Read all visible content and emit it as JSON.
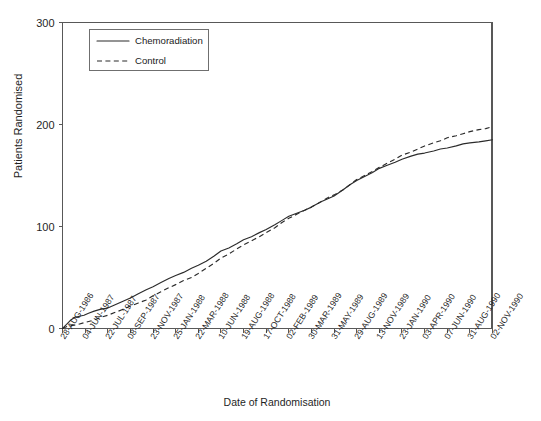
{
  "chart_data": {
    "type": "line",
    "title": "",
    "subtitle": "",
    "xlabel": "Date of Randomisation",
    "ylabel": "Patients Randomised",
    "grid": false,
    "legend_position": "top-left",
    "ylim": [
      0,
      300
    ],
    "yticks": [
      0,
      100,
      200,
      300
    ],
    "ytick_labels": [
      "0",
      "100",
      "200",
      "300"
    ],
    "categories": [
      "28-AUG-1986",
      "04-JUN-1987",
      "22-JUL-1987",
      "08-SEP-1987",
      "23-NOV-1987",
      "25-JAN-1988",
      "22-MAR-1988",
      "10-JUN-1988",
      "19-AUG-1988",
      "17-OCT-1988",
      "02-FEB-1989",
      "30-MAR-1989",
      "31-MAY-1989",
      "29-AUG-1989",
      "13-NOV-1989",
      "23-JAN-1990",
      "03-APR-1990",
      "07-JUN-1990",
      "31-AUG-1990",
      "02-NOV-1990"
    ],
    "series": [
      {
        "name": "Chemoradiation",
        "style": "solid",
        "color": "#2b2b2b",
        "values": [
          0,
          13,
          20,
          30,
          41,
          52,
          62,
          76,
          87,
          97,
          110,
          119,
          130,
          145,
          157,
          166,
          172,
          177,
          182,
          185
        ]
      },
      {
        "name": "Control",
        "style": "dashed",
        "color": "#2b2b2b",
        "values": [
          0,
          6,
          13,
          22,
          32,
          43,
          54,
          69,
          82,
          94,
          108,
          119,
          131,
          146,
          158,
          170,
          179,
          187,
          193,
          198
        ]
      }
    ],
    "series_detail": [
      {
        "name": "Chemoradiation",
        "points": [
          [
            0.0,
            0
          ],
          [
            0.18,
            4
          ],
          [
            0.35,
            8
          ],
          [
            0.55,
            11
          ],
          [
            0.75,
            12
          ],
          [
            0.95,
            13
          ],
          [
            1.15,
            15
          ],
          [
            1.4,
            17
          ],
          [
            1.7,
            19
          ],
          [
            2.0,
            20
          ],
          [
            2.3,
            23
          ],
          [
            2.6,
            26
          ],
          [
            3.0,
            30
          ],
          [
            3.35,
            34
          ],
          [
            3.7,
            38
          ],
          [
            4.0,
            41
          ],
          [
            4.35,
            45
          ],
          [
            4.7,
            49
          ],
          [
            5.0,
            52
          ],
          [
            5.35,
            55
          ],
          [
            5.7,
            59
          ],
          [
            6.0,
            62
          ],
          [
            6.35,
            66
          ],
          [
            6.7,
            71
          ],
          [
            7.0,
            76
          ],
          [
            7.35,
            79
          ],
          [
            7.7,
            83
          ],
          [
            8.0,
            87
          ],
          [
            8.35,
            90
          ],
          [
            8.7,
            94
          ],
          [
            9.0,
            97
          ],
          [
            9.4,
            102
          ],
          [
            9.7,
            106
          ],
          [
            10.0,
            110
          ],
          [
            10.35,
            113
          ],
          [
            10.7,
            116
          ],
          [
            11.0,
            119
          ],
          [
            11.4,
            124
          ],
          [
            11.7,
            127
          ],
          [
            12.0,
            130
          ],
          [
            12.4,
            136
          ],
          [
            12.7,
            141
          ],
          [
            13.0,
            145
          ],
          [
            13.35,
            149
          ],
          [
            13.7,
            153
          ],
          [
            14.0,
            157
          ],
          [
            14.35,
            160
          ],
          [
            14.7,
            163
          ],
          [
            15.0,
            166
          ],
          [
            15.4,
            169
          ],
          [
            15.7,
            171
          ],
          [
            16.0,
            172
          ],
          [
            16.4,
            174
          ],
          [
            16.7,
            176
          ],
          [
            17.0,
            177
          ],
          [
            17.4,
            179
          ],
          [
            17.7,
            181
          ],
          [
            18.0,
            182
          ],
          [
            18.4,
            183
          ],
          [
            18.7,
            184
          ],
          [
            19.0,
            185
          ]
        ]
      },
      {
        "name": "Control",
        "points": [
          [
            0.0,
            0
          ],
          [
            0.2,
            2
          ],
          [
            0.45,
            3
          ],
          [
            0.7,
            4
          ],
          [
            1.0,
            6
          ],
          [
            1.35,
            8
          ],
          [
            1.7,
            11
          ],
          [
            2.0,
            13
          ],
          [
            2.35,
            16
          ],
          [
            2.7,
            19
          ],
          [
            3.0,
            22
          ],
          [
            3.35,
            25
          ],
          [
            3.7,
            28
          ],
          [
            4.0,
            32
          ],
          [
            4.35,
            36
          ],
          [
            4.7,
            40
          ],
          [
            5.0,
            43
          ],
          [
            5.35,
            47
          ],
          [
            5.7,
            50
          ],
          [
            6.0,
            54
          ],
          [
            6.35,
            59
          ],
          [
            6.7,
            64
          ],
          [
            7.0,
            69
          ],
          [
            7.35,
            73
          ],
          [
            7.7,
            78
          ],
          [
            8.0,
            82
          ],
          [
            8.35,
            86
          ],
          [
            8.7,
            90
          ],
          [
            9.0,
            94
          ],
          [
            9.4,
            99
          ],
          [
            9.7,
            104
          ],
          [
            10.0,
            108
          ],
          [
            10.35,
            112
          ],
          [
            10.7,
            116
          ],
          [
            11.0,
            119
          ],
          [
            11.4,
            124
          ],
          [
            11.7,
            128
          ],
          [
            12.0,
            131
          ],
          [
            12.4,
            136
          ],
          [
            12.7,
            141
          ],
          [
            13.0,
            146
          ],
          [
            13.35,
            150
          ],
          [
            13.7,
            154
          ],
          [
            14.0,
            158
          ],
          [
            14.35,
            162
          ],
          [
            14.7,
            166
          ],
          [
            15.0,
            170
          ],
          [
            15.4,
            173
          ],
          [
            15.7,
            176
          ],
          [
            16.0,
            179
          ],
          [
            16.4,
            182
          ],
          [
            16.7,
            184
          ],
          [
            17.0,
            187
          ],
          [
            17.4,
            189
          ],
          [
            17.7,
            191
          ],
          [
            18.0,
            193
          ],
          [
            18.4,
            195
          ],
          [
            18.7,
            196
          ],
          [
            19.0,
            198
          ]
        ]
      }
    ],
    "annotations": []
  },
  "legend": {
    "items": [
      {
        "label": "Chemoradiation",
        "style": "solid"
      },
      {
        "label": "Control",
        "style": "dashed"
      }
    ]
  },
  "axis": {
    "y_label": "Patients Randomised",
    "x_label": "Date of Randomisation"
  }
}
